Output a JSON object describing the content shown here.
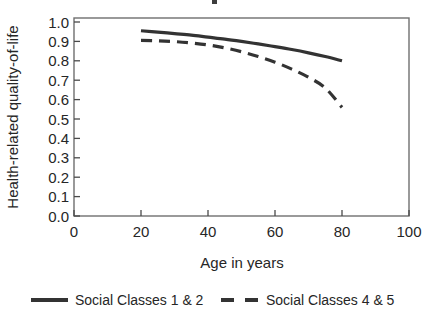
{
  "chart_data": {
    "type": "line",
    "title": "",
    "xlabel": "Age in years",
    "ylabel": "Health-related quality-of-life",
    "xlim": [
      0,
      100
    ],
    "ylim": [
      0.0,
      1.0
    ],
    "xticks": [
      "0",
      "20",
      "40",
      "60",
      "80",
      "100"
    ],
    "xtick_values": [
      0,
      20,
      40,
      60,
      80,
      100
    ],
    "yticks": [
      "0.0",
      "0.1",
      "0.2",
      "0.3",
      "0.4",
      "0.5",
      "0.6",
      "0.7",
      "0.8",
      "0.9",
      "1.0"
    ],
    "ytick_values": [
      0.0,
      0.1,
      0.2,
      0.3,
      0.4,
      0.5,
      0.6,
      0.7,
      0.8,
      0.9,
      1.0
    ],
    "grid": false,
    "legend_position": "below",
    "series": [
      {
        "name": "Social Classes 1 & 2",
        "style": "solid",
        "color": "#333333",
        "x": [
          20,
          25,
          30,
          35,
          40,
          45,
          50,
          55,
          60,
          65,
          70,
          75,
          80
        ],
        "values": [
          0.955,
          0.948,
          0.94,
          0.932,
          0.922,
          0.912,
          0.9,
          0.887,
          0.873,
          0.858,
          0.841,
          0.822,
          0.8
        ]
      },
      {
        "name": "Social Classes 4 & 5",
        "style": "dashed",
        "color": "#333333",
        "x": [
          20,
          25,
          30,
          35,
          40,
          45,
          50,
          55,
          60,
          65,
          70,
          75,
          80
        ],
        "values": [
          0.905,
          0.903,
          0.899,
          0.892,
          0.882,
          0.867,
          0.847,
          0.822,
          0.793,
          0.757,
          0.715,
          0.66,
          0.56
        ]
      }
    ]
  },
  "axes": {
    "x_axis_title": "Age in years",
    "y_axis_title": "Health-related quality-of-life"
  },
  "legend": {
    "entries": [
      {
        "label": "Social Classes 1 & 2",
        "style": "solid"
      },
      {
        "label": "Social Classes 4 & 5",
        "style": "dashed"
      }
    ]
  },
  "ticks": {
    "x": [
      "0",
      "20",
      "40",
      "60",
      "80",
      "100"
    ],
    "y": [
      "1.0",
      "0.9",
      "0.8",
      "0.7",
      "0.6",
      "0.5",
      "0.4",
      "0.3",
      "0.2",
      "0.1",
      "0.0"
    ]
  }
}
